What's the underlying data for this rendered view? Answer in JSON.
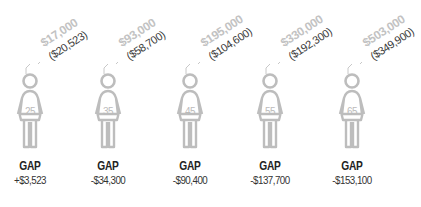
{
  "chart_data": {
    "type": "table",
    "title": "",
    "categories": [
      "25",
      "35",
      "45",
      "55",
      "65"
    ],
    "series": [
      {
        "name": "Salary",
        "values": [
          "$17,000",
          "$93,000",
          "$195,000",
          "$330,000",
          "$503,000"
        ]
      },
      {
        "name": "Comparison (parenthesized)",
        "values": [
          "($20,523)",
          "($58,700)",
          "($104,600)",
          "($192,300)",
          "($349,900)"
        ]
      },
      {
        "name": "GAP",
        "values": [
          "+$3,523",
          "-$34,300",
          "-$90,400",
          "-$137,700",
          "-$153,100"
        ]
      }
    ],
    "numeric": {
      "ages": [
        25,
        35,
        45,
        55,
        65
      ],
      "salary": [
        17000,
        93000,
        195000,
        330000,
        503000
      ],
      "comparison": [
        20523,
        58700,
        104600,
        192300,
        349900
      ],
      "gap": [
        3523,
        -34300,
        -90400,
        -137700,
        -153100
      ]
    }
  },
  "figures": [
    {
      "age": "25",
      "salary": "$17,000",
      "comparison": "($20,523)",
      "gap_label": "GAP",
      "gap_value": "+$3,523"
    },
    {
      "age": "35",
      "salary": "$93,000",
      "comparison": "($58,700)",
      "gap_label": "GAP",
      "gap_value": "-$34,300"
    },
    {
      "age": "45",
      "salary": "$195,000",
      "comparison": "($104,600)",
      "gap_label": "GAP",
      "gap_value": "-$90,400"
    },
    {
      "age": "55",
      "salary": "$330,000",
      "comparison": "($192,300)",
      "gap_label": "GAP",
      "gap_value": "-$137,700"
    },
    {
      "age": "65",
      "salary": "$503,000",
      "comparison": "($349,900)",
      "gap_label": "GAP",
      "gap_value": "-$153,100"
    }
  ],
  "colors": {
    "icon": "#bdbdbd",
    "salary": "#c2c2c2",
    "comparison": "#3a3a3a",
    "gap": "#222222"
  }
}
